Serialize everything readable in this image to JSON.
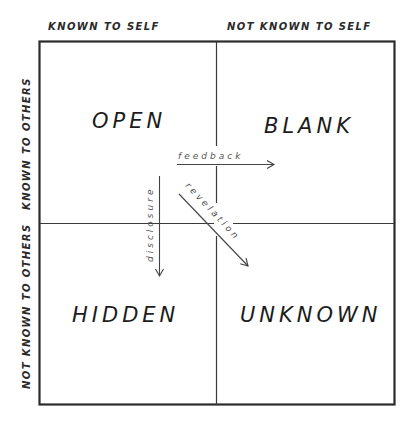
{
  "diagram": {
    "type": "johari-window",
    "columns": [
      {
        "label": "KNOWN TO SELF"
      },
      {
        "label": "NOT KNOWN TO SELF"
      }
    ],
    "rows": [
      {
        "label": "KNOWN TO OTHERS"
      },
      {
        "label": "NOT KNOWN TO OTHERS"
      }
    ],
    "quadrants": {
      "top_left": "OPEN",
      "top_right": "BLANK",
      "bottom_left": "HIDDEN",
      "bottom_right": "UNKNOWN"
    },
    "arrows": {
      "feedback": "feedback",
      "disclosure": "disclosure",
      "revelation": "revelation"
    },
    "colors": {
      "background": "#ffffff",
      "ink": "#2b2b2b"
    }
  }
}
